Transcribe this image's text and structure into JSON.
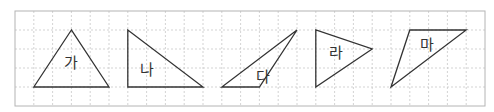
{
  "grid": {
    "x0": 15,
    "y0": 11,
    "cols": 25,
    "rows": 5,
    "cell_w": 18.8,
    "cell_h": 19,
    "line_color": "#c8c8c8",
    "border_color": "#b4b4b4"
  },
  "triangles": [
    {
      "label": "가",
      "points": [
        [
          3,
          1
        ],
        [
          1,
          4
        ],
        [
          5,
          4
        ]
      ],
      "label_pos": [
        3,
        2.75
      ]
    },
    {
      "label": "나",
      "points": [
        [
          6,
          1
        ],
        [
          6,
          4
        ],
        [
          10,
          4
        ]
      ],
      "label_pos": [
        7,
        3.1
      ]
    },
    {
      "label": "다",
      "points": [
        [
          11,
          4
        ],
        [
          13,
          4
        ],
        [
          15,
          1
        ]
      ],
      "label_pos": [
        13.2,
        3.45
      ]
    },
    {
      "label": "라",
      "points": [
        [
          16,
          1
        ],
        [
          16,
          4
        ],
        [
          19,
          2
        ]
      ],
      "label_pos": [
        17.1,
        2.2
      ]
    },
    {
      "label": "마",
      "points": [
        [
          20,
          4
        ],
        [
          21,
          1
        ],
        [
          24,
          1
        ]
      ],
      "label_pos": [
        21.9,
        1.8
      ]
    }
  ]
}
